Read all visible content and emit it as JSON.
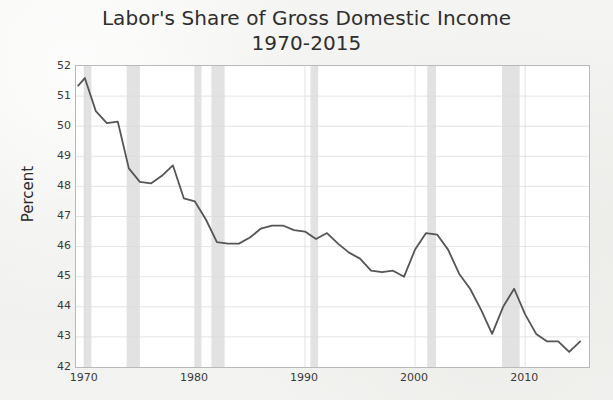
{
  "chart_data": {
    "type": "line",
    "title": "Labor's Share of Gross Domestic Income",
    "subtitle": "1970-2015",
    "xlabel": "",
    "ylabel": "Percent",
    "xlim": [
      1969.2,
      2015.8
    ],
    "ylim": [
      42,
      52
    ],
    "xticks": [
      1970,
      1980,
      1990,
      2000,
      2010
    ],
    "yticks": [
      42,
      43,
      44,
      45,
      46,
      47,
      48,
      49,
      50,
      51,
      52
    ],
    "grid": true,
    "legend": "none",
    "line_color": "#555555",
    "recession_band_color": "#e2e2e2",
    "series": [
      {
        "name": "Labor's Share of Gross Domestic Income",
        "x": [
          1969.4,
          1970,
          1971,
          1972,
          1973,
          1974,
          1975,
          1976,
          1977,
          1978,
          1979,
          1980,
          1981,
          1982,
          1983,
          1984,
          1985,
          1986,
          1987,
          1988,
          1989,
          1990,
          1991,
          1992,
          1993,
          1994,
          1995,
          1996,
          1997,
          1998,
          1999,
          2000,
          2001,
          2002,
          2003,
          2004,
          2005,
          2006,
          2007,
          2008,
          2009,
          2010,
          2011,
          2012,
          2013,
          2014,
          2015
        ],
        "values": [
          51.35,
          51.6,
          50.5,
          50.1,
          50.15,
          48.6,
          48.15,
          48.1,
          48.35,
          48.7,
          47.6,
          47.5,
          46.9,
          46.15,
          46.1,
          46.1,
          46.3,
          46.6,
          46.7,
          46.7,
          46.55,
          46.5,
          46.25,
          46.45,
          46.1,
          45.8,
          45.6,
          45.2,
          45.15,
          45.2,
          45.0,
          45.9,
          46.45,
          46.4,
          45.9,
          45.1,
          44.6,
          43.9,
          43.1,
          44.0,
          44.6,
          43.75,
          43.1,
          42.85,
          42.85,
          42.5,
          42.85
        ]
      }
    ],
    "recession_bands": [
      {
        "start": 1969.9,
        "end": 1970.6,
        "label": "1969-70 recession"
      },
      {
        "start": 1973.8,
        "end": 1975.0,
        "label": "1973-75 recession"
      },
      {
        "start": 1980.0,
        "end": 1980.6,
        "label": "1980 recession"
      },
      {
        "start": 1981.5,
        "end": 1982.7,
        "label": "1981-82 recession"
      },
      {
        "start": 1990.5,
        "end": 1991.2,
        "label": "1990-91 recession"
      },
      {
        "start": 2001.1,
        "end": 2001.9,
        "label": "2001 recession"
      },
      {
        "start": 2007.9,
        "end": 2009.5,
        "label": "2007-09 recession"
      }
    ]
  },
  "axis": {
    "ylabel": "Percent",
    "yticks": [
      "52",
      "51",
      "50",
      "49",
      "48",
      "47",
      "46",
      "45",
      "44",
      "43",
      "42"
    ],
    "xticks": [
      "1970",
      "1980",
      "1990",
      "2000",
      "2010"
    ]
  },
  "title": {
    "line1": "Labor's Share of Gross Domestic Income",
    "line2": "1970-2015"
  }
}
